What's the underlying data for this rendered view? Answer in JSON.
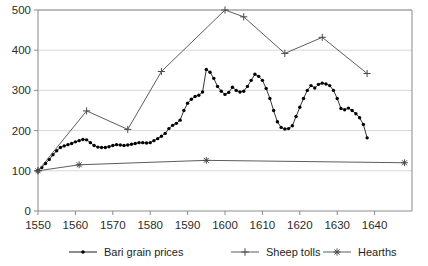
{
  "chart_data": {
    "type": "line",
    "title": "",
    "subtitle": "",
    "xlabel": "",
    "ylabel": "",
    "xlim": [
      1550,
      1650
    ],
    "ylim": [
      0,
      500
    ],
    "grid": true,
    "grid_axis": "y",
    "legend_position": "bottom",
    "x_ticks": [
      1550,
      1560,
      1570,
      1580,
      1590,
      1600,
      1610,
      1620,
      1630,
      1640
    ],
    "x_tick_labels": [
      "1550",
      "1560",
      "1570",
      "1580",
      "1590",
      "1600",
      "1610",
      "1620",
      "1630",
      "1640"
    ],
    "y_ticks": [
      0,
      100,
      200,
      300,
      400,
      500
    ],
    "y_tick_labels": [
      "0",
      "100",
      "200",
      "300",
      "400",
      "500"
    ],
    "series": [
      {
        "name": "Bari grain prices",
        "marker": "dot",
        "color": "#000000",
        "points": [
          [
            1550,
            100
          ],
          [
            1551,
            108
          ],
          [
            1552,
            118
          ],
          [
            1553,
            128
          ],
          [
            1554,
            140
          ],
          [
            1555,
            150
          ],
          [
            1556,
            158
          ],
          [
            1557,
            162
          ],
          [
            1558,
            165
          ],
          [
            1559,
            168
          ],
          [
            1560,
            172
          ],
          [
            1561,
            175
          ],
          [
            1562,
            178
          ],
          [
            1563,
            177
          ],
          [
            1564,
            170
          ],
          [
            1565,
            163
          ],
          [
            1566,
            159
          ],
          [
            1567,
            158
          ],
          [
            1568,
            158
          ],
          [
            1569,
            160
          ],
          [
            1570,
            163
          ],
          [
            1571,
            165
          ],
          [
            1572,
            164
          ],
          [
            1573,
            163
          ],
          [
            1574,
            164
          ],
          [
            1575,
            166
          ],
          [
            1576,
            168
          ],
          [
            1577,
            170
          ],
          [
            1578,
            170
          ],
          [
            1579,
            169
          ],
          [
            1580,
            170
          ],
          [
            1581,
            175
          ],
          [
            1582,
            180
          ],
          [
            1583,
            186
          ],
          [
            1584,
            193
          ],
          [
            1585,
            205
          ],
          [
            1586,
            213
          ],
          [
            1587,
            218
          ],
          [
            1588,
            226
          ],
          [
            1589,
            250
          ],
          [
            1590,
            268
          ],
          [
            1591,
            278
          ],
          [
            1592,
            285
          ],
          [
            1593,
            288
          ],
          [
            1594,
            296
          ],
          [
            1595,
            352
          ],
          [
            1596,
            345
          ],
          [
            1597,
            330
          ],
          [
            1598,
            310
          ],
          [
            1599,
            298
          ],
          [
            1600,
            290
          ],
          [
            1601,
            295
          ],
          [
            1602,
            308
          ],
          [
            1603,
            300
          ],
          [
            1604,
            296
          ],
          [
            1605,
            298
          ],
          [
            1606,
            310
          ],
          [
            1607,
            325
          ],
          [
            1608,
            340
          ],
          [
            1609,
            335
          ],
          [
            1610,
            325
          ],
          [
            1611,
            305
          ],
          [
            1612,
            280
          ],
          [
            1613,
            250
          ],
          [
            1614,
            222
          ],
          [
            1615,
            208
          ],
          [
            1616,
            204
          ],
          [
            1617,
            205
          ],
          [
            1618,
            212
          ],
          [
            1619,
            235
          ],
          [
            1620,
            258
          ],
          [
            1621,
            280
          ],
          [
            1622,
            300
          ],
          [
            1623,
            312
          ],
          [
            1624,
            306
          ],
          [
            1625,
            315
          ],
          [
            1626,
            318
          ],
          [
            1627,
            316
          ],
          [
            1628,
            312
          ],
          [
            1629,
            300
          ],
          [
            1630,
            280
          ],
          [
            1631,
            255
          ],
          [
            1632,
            252
          ],
          [
            1633,
            256
          ],
          [
            1634,
            250
          ],
          [
            1635,
            242
          ],
          [
            1636,
            232
          ],
          [
            1637,
            215
          ],
          [
            1638,
            182
          ]
        ]
      },
      {
        "name": "Sheep tolls",
        "marker": "plus",
        "color": "#4a4a4a",
        "points": [
          [
            1550,
            100
          ],
          [
            1563,
            249
          ],
          [
            1574,
            203
          ],
          [
            1583,
            347
          ],
          [
            1600,
            500
          ],
          [
            1605,
            483
          ],
          [
            1616,
            392
          ],
          [
            1626,
            432
          ],
          [
            1638,
            342
          ]
        ]
      },
      {
        "name": "Hearths",
        "marker": "asterisk",
        "color": "#4a4a4a",
        "points": [
          [
            1550,
            100
          ],
          [
            1561,
            115
          ],
          [
            1595,
            126
          ],
          [
            1648,
            120
          ]
        ]
      }
    ]
  },
  "legend": {
    "items": [
      {
        "label": "Bari grain prices",
        "marker": "dot"
      },
      {
        "label": "Sheep tolls",
        "marker": "plus"
      },
      {
        "label": "Hearths",
        "marker": "asterisk"
      }
    ]
  },
  "colors": {
    "axis": "#8a8a8a",
    "grid": "#d8d8d8",
    "text": "#2b2b2b",
    "series_primary": "#000000",
    "series_secondary": "#4a4a4a"
  }
}
